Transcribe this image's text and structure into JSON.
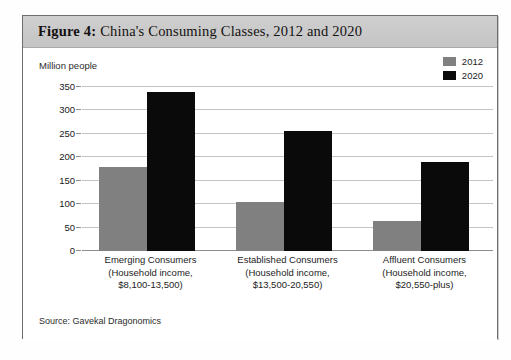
{
  "figure": {
    "number_label": "Figure 4:",
    "title_text": " China's Consuming Classes, 2012 and 2020",
    "source": "Source: Gavekal Dragonomics",
    "axis_note": "Million people"
  },
  "colors": {
    "series_2012": "#808080",
    "series_2020": "#0a0a0a",
    "gridline": "#c4c4c4",
    "card_border": "#6e6e6e",
    "title_bar": "#c8c8c8"
  },
  "legend": {
    "position": "top-right",
    "entries": [
      {
        "label": "2012",
        "swatch": "#808080"
      },
      {
        "label": "2020",
        "swatch": "#0a0a0a"
      }
    ]
  },
  "chart_data": {
    "type": "bar",
    "title": "Figure 4: China's Consuming Classes, 2012 and 2020",
    "subtitle": "",
    "xlabel": "",
    "ylabel": "Million people",
    "ylim": [
      0,
      350
    ],
    "yticks": [
      0,
      50,
      100,
      150,
      200,
      250,
      300,
      350
    ],
    "ytick_labels": [
      "0",
      "50",
      "100",
      "150",
      "200",
      "250",
      "300",
      "350"
    ],
    "grid": true,
    "legend_position": "top-right",
    "categories": [
      "Emerging Consumers (Household income, $8,100-13,500)",
      "Established Consumers (Household income, $13,500-20,550)",
      "Affluent Consumers (Household income, $20,550-plus)"
    ],
    "category_lines": [
      [
        "Emerging Consumers",
        "(Household income,",
        "$8,100-13,500)"
      ],
      [
        "Established Consumers",
        "(Household income,",
        "$13,500-20,550)"
      ],
      [
        "Affluent Consumers",
        "(Household income,",
        "$20,550-plus)"
      ]
    ],
    "series": [
      {
        "name": "2012",
        "color": "#808080",
        "values": [
          180,
          105,
          65
        ]
      },
      {
        "name": "2020",
        "color": "#0a0a0a",
        "values": [
          340,
          257,
          190
        ]
      }
    ],
    "source": "Source: Gavekal Dragonomics"
  }
}
